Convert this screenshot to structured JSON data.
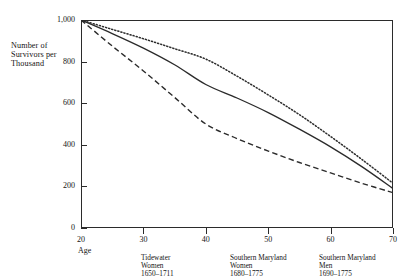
{
  "chart_data": {
    "type": "line",
    "title": "",
    "subtitle": "",
    "xlabel": "Age",
    "ylabel": "Number of Survivors per Thousand",
    "xlim": [
      20,
      70
    ],
    "ylim": [
      0,
      1000
    ],
    "grid": false,
    "legend_position": "below-axis-annotations",
    "xticks": [
      "20",
      "30",
      "40",
      "50",
      "60",
      "70"
    ],
    "xtick_values": [
      20,
      30,
      40,
      50,
      60,
      70
    ],
    "yticks": [
      "0",
      "200",
      "400",
      "600",
      "800",
      "1,000"
    ],
    "ytick_values": [
      0,
      200,
      400,
      600,
      800,
      1000
    ],
    "x": [
      20,
      25,
      30,
      35,
      40,
      45,
      50,
      55,
      60,
      65,
      70
    ],
    "series": [
      {
        "name": "Southern Maryland Men 1690-1775",
        "style": "dotted",
        "color": "#2b2b2b",
        "values": [
          1000,
          955,
          910,
          862,
          812,
          730,
          640,
          545,
          440,
          330,
          215
        ]
      },
      {
        "name": "Southern Maryland Women 1680-1775",
        "style": "solid",
        "color": "#2b2b2b",
        "values": [
          1000,
          935,
          865,
          785,
          690,
          625,
          555,
          475,
          390,
          295,
          190
        ]
      },
      {
        "name": "Tidewater Women 1650-1711",
        "style": "dashed",
        "color": "#2b2b2b",
        "values": [
          1000,
          875,
          755,
          628,
          500,
          430,
          370,
          315,
          265,
          215,
          170
        ]
      }
    ],
    "annotations": [
      {
        "line1": "Tidewater",
        "line2": "Women",
        "line3": "1650–1711",
        "x_px": 141
      },
      {
        "line1": "Southern Maryland",
        "line2": "Women",
        "line3": "1680–1775",
        "x_px": 230
      },
      {
        "line1": "Southern Maryland",
        "line2": "Men",
        "line3": "1690–1775",
        "x_px": 319
      }
    ]
  },
  "axes": {
    "ylabel_line1": "Number of",
    "ylabel_line2": "Survivors per",
    "ylabel_line3": "Thousand",
    "xlabel": "Age"
  }
}
